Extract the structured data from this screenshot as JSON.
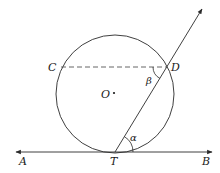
{
  "diagram": {
    "labels": {
      "A": "A",
      "B": "B",
      "C": "C",
      "D": "D",
      "O": "O",
      "T": "T",
      "alpha": "α",
      "beta": "β"
    },
    "colors": {
      "stroke": "#2a2a2a",
      "chord": "#555555"
    }
  }
}
